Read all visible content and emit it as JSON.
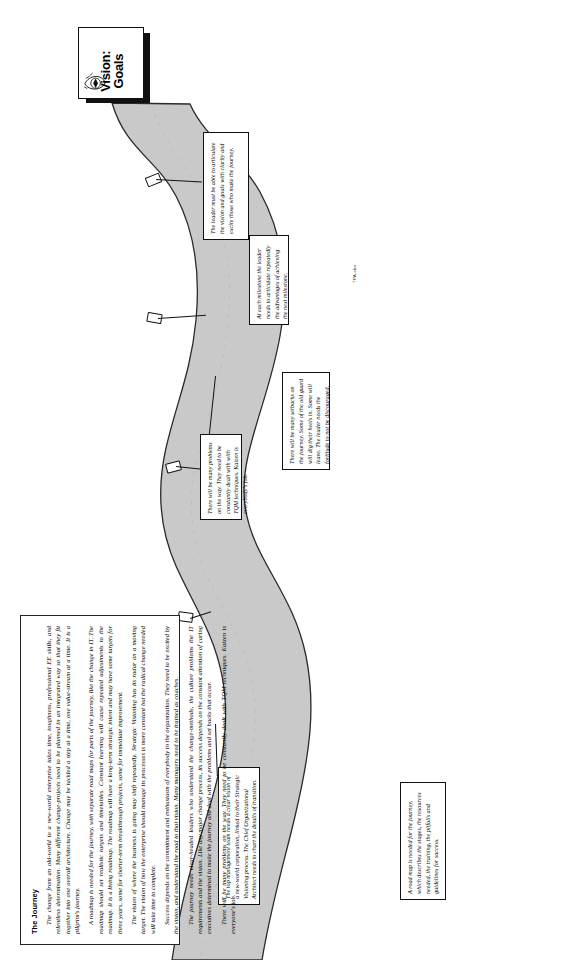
{
  "page": {
    "orientation": "landscape-rotated",
    "credit": "TPA-sbn"
  },
  "signpost": {
    "line1": "Vision:",
    "line2": "Goals",
    "icon": "eye-icon"
  },
  "body": {
    "heading": "The Journey",
    "paragraphs": [
      "The change from an old-world to a new-world enterprise takes time, toughness, professional EE skills, and relentless determination. Many different change-projects need to be planned in an integrated way so that they fit together into one overall architecture. Change may be tackled a step at a time, one value-stream at a time. It is a pilgrim's journey.",
      "A roadmap is needed for the journey, with separate road maps for parts of the journey, like the change in IT. The roadmap should set realistic targets and timetables. Constant learning will cause repeated adjustments to the roadmap. It is a living roadmap. The roadmap will have a long-term strategic intent and may have some targets for three years, some for shorter-term breakthrough projects, some for immediate improvement.",
      "The vision of where the business is going may shift repeatedly. Strategic Visioning has its radar on a moving target. The vision of how the enterprise should manage its processes is more constant but the radical change needed will take time to complete.",
      "Success depends on the commitment and enthusiasm of everybody in the organization. They need to be excited by the vision, and understand the road to that vision. Many managers need to be trained as coaches.",
      "The journey needs clear-headed leaders who understand the change-methods, the culture problems the IT requirements and the vision. Like any major change process, its success depends on the constant attention of caring executives determined to make the journey and deal with the problems and set backs that occur.",
      "There will be many problems on the way. They need to be constantly dealt with TQM techniques. Kaizen is everyone's job."
    ]
  },
  "callouts": [
    {
      "id": "leader-articulate",
      "text": "The leader must be able to articulate the vision and goals with clarity and excite those who make the journey."
    },
    {
      "id": "milestone-articulate",
      "text": "At each milestone the leader needs to articulate repeatedly the advantages of achieving the next milestone."
    },
    {
      "id": "setbacks",
      "text": "There will be many setbacks on the journey. Some of the old guard will dig their heels in. Some will leave. The leader needs the fortitude to not be discouraged."
    },
    {
      "id": "problems-kaizen",
      "text": "There will be many problems on the way. They need to be constantly dealt with with TQM techniques. Kaizen is everybody's job."
    },
    {
      "id": "roadmap",
      "text": "A road map is needed for the journey, which describes the stages, the resources needed, the training, the pitfalls and guidelines for success."
    },
    {
      "id": "top-management",
      "text": "The top management team needs a clear vision of a new-world corporation, linked to their Strategic Visioning process. The Chief Organizational Architect needs to chart the details of transition."
    }
  ],
  "markers": [
    {
      "id": "milestone-1"
    },
    {
      "id": "milestone-2"
    },
    {
      "id": "milestone-3"
    },
    {
      "id": "milestone-4"
    }
  ],
  "colors": {
    "road_fill": "#c9c9c9",
    "road_stroke": "#2a2a2a",
    "ink": "#111111",
    "paper": "#ffffff"
  }
}
